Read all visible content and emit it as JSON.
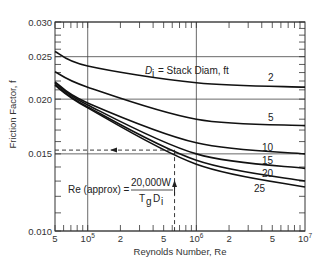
{
  "chart_data": {
    "type": "line",
    "title": "",
    "xlabel": "Reynolds Number, Re",
    "ylabel": "Friction Factor, f",
    "xscale": "log",
    "yscale": "log",
    "xlim": [
      50000,
      10000000
    ],
    "ylim": [
      0.01,
      0.03
    ],
    "grid": true,
    "x_tick_labels": [
      {
        "value": 50000,
        "label": "5"
      },
      {
        "value": 100000,
        "label": "10",
        "sup": "5"
      },
      {
        "value": 200000,
        "label": "2"
      },
      {
        "value": 500000,
        "label": "5"
      },
      {
        "value": 1000000,
        "label": "10",
        "sup": "6"
      },
      {
        "value": 2000000,
        "label": "2"
      },
      {
        "value": 5000000,
        "label": "5"
      },
      {
        "value": 10000000,
        "label": "10",
        "sup": "7"
      }
    ],
    "y_tick_labels": [
      {
        "value": 0.03,
        "label": "0.030"
      },
      {
        "value": 0.025,
        "label": "0.025"
      },
      {
        "value": 0.02,
        "label": "0.020"
      },
      {
        "value": 0.015,
        "label": "0.015"
      },
      {
        "value": 0.01,
        "label": "0.010"
      }
    ],
    "legend_title": "Di = Stack Diam, ft",
    "x": [
      50000,
      100000,
      1000000,
      10000000
    ],
    "series": [
      {
        "name": "2",
        "values": [
          0.0257,
          0.0238,
          0.0218,
          0.0213
        ]
      },
      {
        "name": "5",
        "values": [
          0.0231,
          0.0213,
          0.018,
          0.0174
        ]
      },
      {
        "name": "10",
        "values": [
          0.0219,
          0.0196,
          0.0159,
          0.015
        ]
      },
      {
        "name": "15",
        "values": [
          0.0218,
          0.0194,
          0.015,
          0.0139
        ]
      },
      {
        "name": "20",
        "values": [
          0.0216,
          0.0192,
          0.0145,
          0.013
        ]
      },
      {
        "name": "25",
        "values": [
          0.0215,
          0.0191,
          0.0142,
          0.0126
        ]
      }
    ],
    "annotations": {
      "formula_lhs": "Re (approx) =",
      "formula_numerator": "20,000W",
      "formula_denominator_T": "T",
      "formula_denominator_T_sub": "g",
      "formula_denominator_D": "D",
      "formula_denominator_D_sub": "i",
      "example_reading": {
        "re": 630000,
        "f": 0.0153
      }
    }
  },
  "legend": {
    "d_symbol": "D",
    "d_sub": "i",
    "text": "= Stack Diam, ft"
  }
}
